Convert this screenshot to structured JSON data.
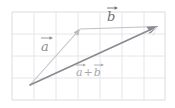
{
  "figure": {
    "background_color": "#ffffff",
    "grid": {
      "line_color": "#e3e3e6",
      "border_color": "#d8d8dc",
      "cell_size_px": 22,
      "columns": 7,
      "rows": 4,
      "origin_x_px": 12,
      "origin_y_px": 12
    },
    "labels": {
      "vector_a": {
        "letter": "a",
        "accent": "arrow",
        "color": "#8e8e92"
      },
      "vector_b": {
        "letter": "b",
        "accent": "arrow",
        "color": "#6f6f74"
      },
      "vector_sum": {
        "first_letter": "a",
        "operator": "+",
        "second_letter": "b",
        "accent": "arrow",
        "color": "#a9a9ae"
      }
    },
    "vectors": [
      {
        "name": "a",
        "from": [
          30,
          85
        ],
        "to": [
          80,
          29
        ],
        "color": "#c2c2c7",
        "stroke_width": 1.1,
        "arrowhead": true
      },
      {
        "name": "b",
        "from": [
          80,
          29
        ],
        "to": [
          157,
          27
        ],
        "color": "#b9b9be",
        "stroke_width": 1.1,
        "arrowhead": false
      },
      {
        "name": "a+b",
        "from": [
          30,
          85
        ],
        "to": [
          157,
          27
        ],
        "color": "#8a8a90",
        "stroke_width": 1.6,
        "arrowhead": true
      }
    ]
  }
}
